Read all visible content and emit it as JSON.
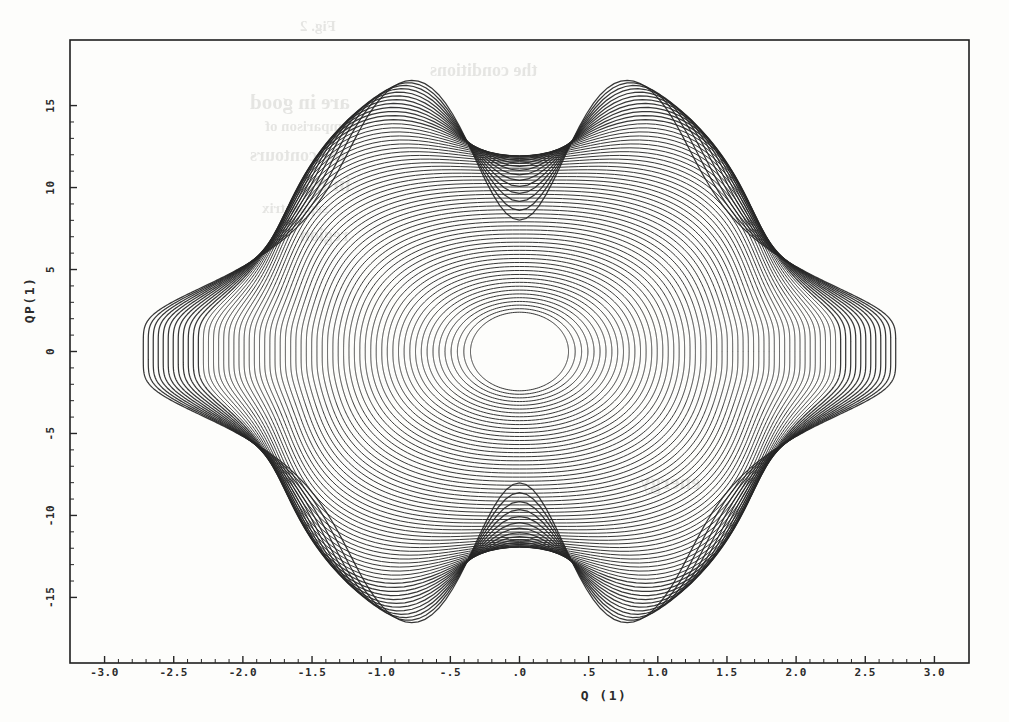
{
  "figure": {
    "kind": "phase-space-contour-plot",
    "background_color": "#fdfdfb",
    "ink_color": "#262626",
    "frame_color": "#1f1f1f"
  },
  "ghost_text": [
    {
      "text": "Fig. 2",
      "x": 300,
      "y": 18
    },
    {
      "text": "the conditions",
      "x": 430,
      "y": 60
    },
    {
      "text": "are in good",
      "x": 250,
      "y": 90
    },
    {
      "text": "comparison of",
      "x": 265,
      "y": 118
    },
    {
      "text": "the contours",
      "x": 250,
      "y": 145
    },
    {
      "text": "in the",
      "x": 300,
      "y": 172
    },
    {
      "text": "separatrix",
      "x": 262,
      "y": 200
    },
    {
      "text": "region",
      "x": 300,
      "y": 225
    },
    {
      "text": "energy",
      "x": 640,
      "y": 470
    }
  ],
  "chart_data": {
    "type": "line",
    "title": "",
    "subtitle": "",
    "xlabel": "Q (1)",
    "ylabel": "QP(1)",
    "xlim": [
      -3.25,
      3.25
    ],
    "ylim": [
      -19.0,
      19.0
    ],
    "grid": false,
    "legend": null,
    "legend_position": "none",
    "xticks": [
      -3.0,
      -2.5,
      -2.0,
      -1.5,
      -1.0,
      -0.5,
      0.0,
      0.5,
      1.0,
      1.5,
      2.0,
      2.5,
      3.0
    ],
    "xticklabels": [
      "-3.0",
      "-2.5",
      "-2.0",
      "-1.5",
      "-1.0",
      "-.5",
      ".0",
      ".5",
      "1.0",
      "1.5",
      "2.0",
      "2.5",
      "3.0"
    ],
    "yticks": [
      -15,
      -10,
      -5,
      0,
      5,
      10,
      15
    ],
    "yticklabels": [
      "-15",
      "-10",
      "-5",
      "0",
      "5",
      "10",
      "15"
    ],
    "xminor_ticks_per_interval": 4,
    "yminor_ticks_per_interval": 4,
    "n_contours": 62,
    "center": [
      0.0,
      0.0
    ],
    "pinch_points": [
      [
        0.0,
        8.2
      ],
      [
        0.0,
        -8.2
      ]
    ],
    "outer_extent": {
      "q_max": 2.72,
      "q_min": -2.86,
      "qp_max": 17.4,
      "qp_min": -17.4
    },
    "series": [
      {
        "name": "contour-level-family",
        "level_index_min": 1,
        "level_index_max": 62,
        "closed": true
      }
    ],
    "contour_levels": [
      0.04,
      0.08,
      0.12,
      0.16,
      0.2,
      0.25,
      0.3,
      0.35,
      0.4,
      0.45,
      0.5,
      0.55,
      0.6,
      0.65,
      0.7,
      0.75,
      0.8,
      0.85,
      0.9,
      0.93,
      0.95,
      0.965,
      0.975,
      0.982,
      0.988,
      0.992,
      0.995,
      0.997,
      0.998,
      0.999,
      1.001,
      1.003,
      1.006,
      1.01,
      1.016,
      1.024,
      1.034,
      1.046,
      1.06,
      1.078,
      1.1,
      1.126,
      1.156,
      1.19,
      1.23,
      1.275,
      1.325,
      1.38,
      1.44,
      1.505,
      1.575,
      1.65,
      1.73,
      1.815,
      1.905,
      2.0,
      2.1,
      2.205,
      2.315,
      2.43,
      2.55,
      2.675
    ]
  },
  "axes": {
    "frame": {
      "left_px": 70,
      "top_px": 40,
      "right_px": 969,
      "bottom_px": 663
    },
    "xtick_label_row_y": 676,
    "xaxis_title_y": 700,
    "yaxis_title_x": 34
  }
}
